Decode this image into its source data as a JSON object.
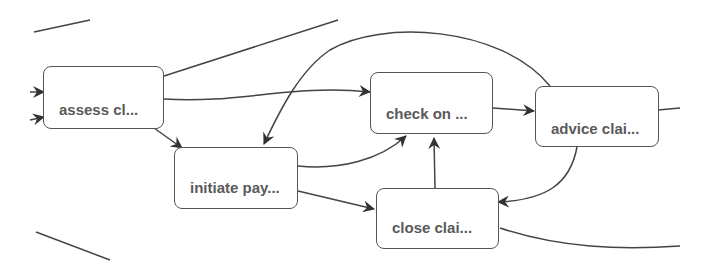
{
  "diagram": {
    "type": "process-flow",
    "nodes": [
      {
        "id": "assess",
        "label": "assess cl..."
      },
      {
        "id": "check",
        "label": "check on ..."
      },
      {
        "id": "advice",
        "label": "advice clai..."
      },
      {
        "id": "initiate",
        "label": "initiate pay..."
      },
      {
        "id": "close",
        "label": "close clai..."
      }
    ],
    "edges": [
      {
        "from": "assess",
        "to": "check"
      },
      {
        "from": "assess",
        "to": "initiate"
      },
      {
        "from": "initiate",
        "to": "check"
      },
      {
        "from": "initiate",
        "to": "close"
      },
      {
        "from": "check",
        "to": "advice"
      },
      {
        "from": "advice",
        "to": "initiate"
      },
      {
        "from": "advice",
        "to": "close"
      },
      {
        "from": "close",
        "to": "check"
      }
    ],
    "colors": {
      "stroke": "#555555",
      "text": "#5a5a5a",
      "background": "#ffffff"
    }
  }
}
